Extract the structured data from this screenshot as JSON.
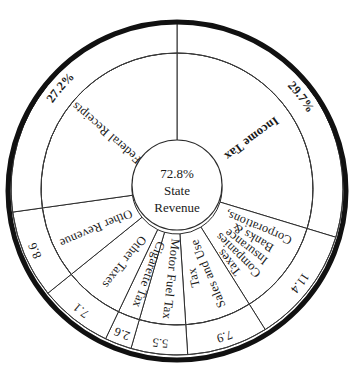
{
  "chart_data": {
    "type": "pie",
    "title": "",
    "subtitle": "",
    "xlabel": "",
    "ylabel": "",
    "center": {
      "percent": "72.8%",
      "line1": "State",
      "line2": "Revenue",
      "value": 72.8
    },
    "units": "percent of total revenue",
    "legend_position": "none",
    "grid": false,
    "note": "Inner ring wedges are revenue categories; outer ring holds each wedge's percentage value. Center hub shows State Revenue share (all categories except Federal Receipts).",
    "categories": [
      "Income Tax",
      "Corporations, Banks & Insurance Companies Taxes",
      "Sales and Use Tax",
      "Motor Fuel Tax",
      "Cigarette Tax",
      "Other Taxes",
      "Other Revenue",
      "Federal Receipts"
    ],
    "values": [
      29.7,
      11.4,
      7.9,
      5.5,
      2.6,
      7.1,
      8.6,
      27.2
    ],
    "total": 100.0,
    "slices": [
      {
        "id": "income-tax",
        "label": "Income Tax",
        "label_lines": [
          "Income Tax"
        ],
        "value": 29.7,
        "value_label": "29.7%",
        "start_deg": 0,
        "end_deg": 106.9,
        "label_bold": true
      },
      {
        "id": "corporations-banks-insurance",
        "label": "Corporations, Banks & Insurance Companies Taxes",
        "label_lines": [
          "Corporations,",
          "Banks &",
          "Insurance",
          "Companies",
          "Taxes"
        ],
        "value": 11.4,
        "value_label": "11.4",
        "start_deg": 106.9,
        "end_deg": 147.9,
        "label_bold": false
      },
      {
        "id": "sales-and-use-tax",
        "label": "Sales and Use Tax",
        "label_lines": [
          "Sales and Use",
          "Tax"
        ],
        "value": 7.9,
        "value_label": "7.9",
        "start_deg": 147.9,
        "end_deg": 176.3,
        "label_bold": false
      },
      {
        "id": "motor-fuel-tax",
        "label": "Motor Fuel Tax",
        "label_lines": [
          "Motor Fuel Tax"
        ],
        "value": 5.5,
        "value_label": "5.5",
        "start_deg": 176.3,
        "end_deg": 196.1,
        "label_bold": false
      },
      {
        "id": "cigarette-tax",
        "label": "Cigarette Tax",
        "label_lines": [
          "Cigarette Tax"
        ],
        "value": 2.6,
        "value_label": "2.6",
        "start_deg": 196.1,
        "end_deg": 205.5,
        "label_bold": false
      },
      {
        "id": "other-taxes",
        "label": "Other Taxes",
        "label_lines": [
          "Other Taxes"
        ],
        "value": 7.1,
        "value_label": "7.1",
        "start_deg": 205.5,
        "end_deg": 231.1,
        "label_bold": false
      },
      {
        "id": "other-revenue",
        "label": "Other Revenue",
        "label_lines": [
          "Other Revenue"
        ],
        "value": 8.6,
        "value_label": "8.6",
        "start_deg": 231.1,
        "end_deg": 262.0,
        "label_bold": false
      },
      {
        "id": "federal-receipts",
        "label": "Federal Receipts",
        "label_lines": [
          "Federal Receipts"
        ],
        "value": 27.2,
        "value_label": "27.2%",
        "start_deg": 262.0,
        "end_deg": 360.0,
        "label_bold": false
      }
    ],
    "colors": {
      "background": "#ffffff",
      "outline": "#111111",
      "wedge_fill": "#ffffff",
      "wedge_stroke": "#2b2b2b",
      "text": "#1a1a1a"
    }
  }
}
